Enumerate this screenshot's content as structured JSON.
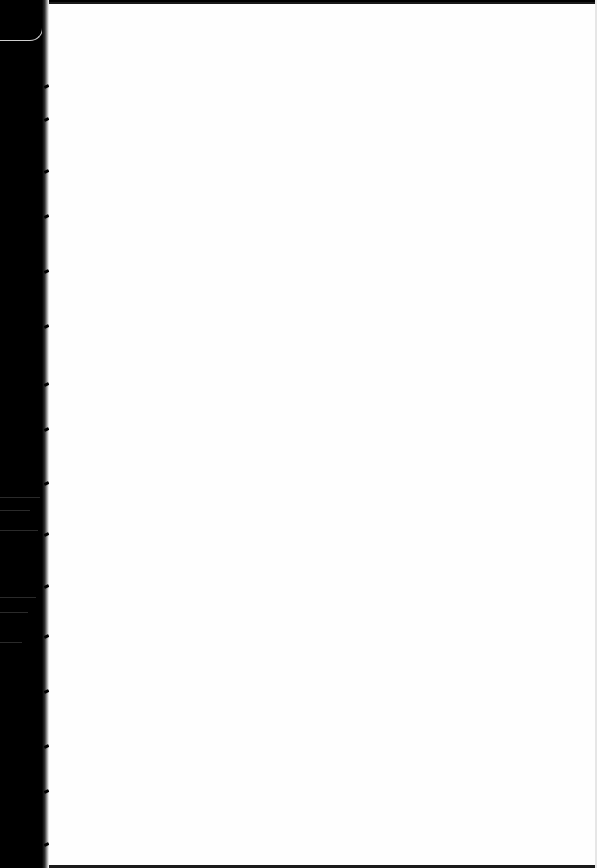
{
  "document": {
    "type": "scanned-page",
    "content": "",
    "colors": {
      "page": "#fefefe",
      "gutter": "#000000",
      "thread": "#cfcfcf"
    },
    "stitch_marks_y": [
      85,
      118,
      170,
      215,
      270,
      325,
      383,
      428,
      482,
      533,
      585,
      635,
      690,
      745,
      790,
      843
    ]
  }
}
